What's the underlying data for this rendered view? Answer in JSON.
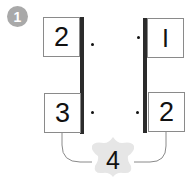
{
  "problem": {
    "number": "1",
    "left_column": [
      "2",
      "3"
    ],
    "right_column": [
      "I",
      "2"
    ],
    "result": "4"
  },
  "colors": {
    "badge": "#a9a9a9",
    "bar": "#2b2b2b",
    "box_border": "#8a8a8a",
    "star_fill": "#e6e6e6",
    "wire": "#8a8a8a"
  }
}
